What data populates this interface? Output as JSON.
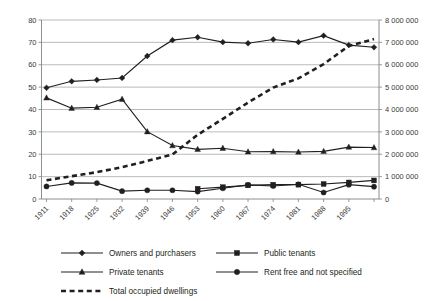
{
  "chart_data": {
    "type": "line",
    "title": "",
    "subtitle": "",
    "xlabel": "",
    "ylabel": "",
    "y2label": "",
    "grid": true,
    "legend_position": "bottom",
    "x": [
      "1911",
      "1918",
      "1925",
      "1932",
      "1939",
      "1946",
      "1953",
      "1960",
      "1967",
      "1974",
      "1981",
      "1988",
      "1995",
      "2001"
    ],
    "xtick_labels": [
      "1911",
      "1918",
      "1925",
      "1932",
      "1939",
      "1946",
      "1953",
      "1960",
      "1967",
      "1974",
      "1981",
      "1988",
      "1995"
    ],
    "ytick_labels": [
      "0",
      "10",
      "20",
      "30",
      "40",
      "50",
      "60",
      "70",
      "80"
    ],
    "ylim": [
      0,
      80
    ],
    "y2tick_labels": [
      "0",
      "1 000 000",
      "2 000 000",
      "3 000 000",
      "4 000 000",
      "5 000 000",
      "6 000 000",
      "7 000 000",
      "8 000 000"
    ],
    "y2lim": [
      0,
      8000000
    ],
    "series": [
      {
        "name": "Owners and purchasers",
        "marker": "diamond",
        "style": "solid",
        "axis": "left",
        "values": [
          49.7,
          52.6,
          53.2,
          54.1,
          63.9,
          71.0,
          72.3,
          70.1,
          69.6,
          71.3,
          70.1,
          73.0,
          68.8,
          67.8
        ]
      },
      {
        "name": "Private tenants",
        "marker": "triangle",
        "style": "solid",
        "axis": "left",
        "values": [
          45.2,
          40.6,
          41.0,
          44.6,
          30.1,
          23.9,
          22.2,
          22.7,
          21.1,
          21.2,
          21.0,
          21.3,
          23.2,
          23.0
        ]
      },
      {
        "name": "Public tenants",
        "marker": "square",
        "style": "solid",
        "axis": "left",
        "values": [
          null,
          null,
          null,
          null,
          null,
          null,
          4.6,
          5.3,
          6.1,
          6.4,
          6.4,
          6.7,
          7.4,
          8.3
        ]
      },
      {
        "name": "Rent free and not specified",
        "marker": "circle",
        "style": "solid",
        "axis": "left",
        "values": [
          5.6,
          7.2,
          7.1,
          3.5,
          3.9,
          3.9,
          3.3,
          4.8,
          6.3,
          5.8,
          6.6,
          2.9,
          6.4,
          5.5
        ]
      },
      {
        "name": "Total occupied dwellings",
        "marker": "none",
        "style": "dashed",
        "axis": "right",
        "values": [
          840000,
          1020000,
          1200000,
          1420000,
          1700000,
          1990000,
          2870000,
          3580000,
          4310000,
          4980000,
          5390000,
          6030000,
          6840000,
          7150000
        ]
      }
    ]
  },
  "legend": {
    "entries": [
      {
        "label": "Owners and purchasers",
        "marker": "diamond",
        "style": "solid"
      },
      {
        "label": "Public tenants",
        "marker": "square",
        "style": "solid"
      },
      {
        "label": "Private tenants",
        "marker": "triangle",
        "style": "solid"
      },
      {
        "label": "Rent free and not specified",
        "marker": "circle",
        "style": "solid"
      },
      {
        "label": "Total occupied dwellings",
        "marker": "none",
        "style": "dashed"
      }
    ]
  },
  "colors": {
    "ink": "#231f20",
    "grid": "#a7a9ac",
    "axis": "#808285",
    "background": "#ffffff"
  }
}
